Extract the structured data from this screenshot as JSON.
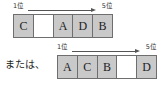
{
  "figure": {
    "connector_text": "または、",
    "scale": {
      "start_label": "1位",
      "end_label": "5位",
      "arrow_icon": "right-arrow-icon"
    },
    "orderings": [
      {
        "name": "first-ordering",
        "cells": [
          {
            "label": "C",
            "empty": false
          },
          {
            "label": "",
            "empty": true
          },
          {
            "label": "A",
            "empty": false
          },
          {
            "label": "D",
            "empty": false
          },
          {
            "label": "B",
            "empty": false
          }
        ]
      },
      {
        "name": "second-ordering",
        "cells": [
          {
            "label": "A",
            "empty": false
          },
          {
            "label": "C",
            "empty": false
          },
          {
            "label": "B",
            "empty": false
          },
          {
            "label": "",
            "empty": true
          },
          {
            "label": "D",
            "empty": false
          }
        ]
      }
    ]
  },
  "colors": {
    "cell_fill": "#c9c9c9",
    "cell_empty_fill": "#ffffff",
    "border": "#6e6e6e",
    "arrow": "#555555",
    "text": "#1d1d1d"
  }
}
